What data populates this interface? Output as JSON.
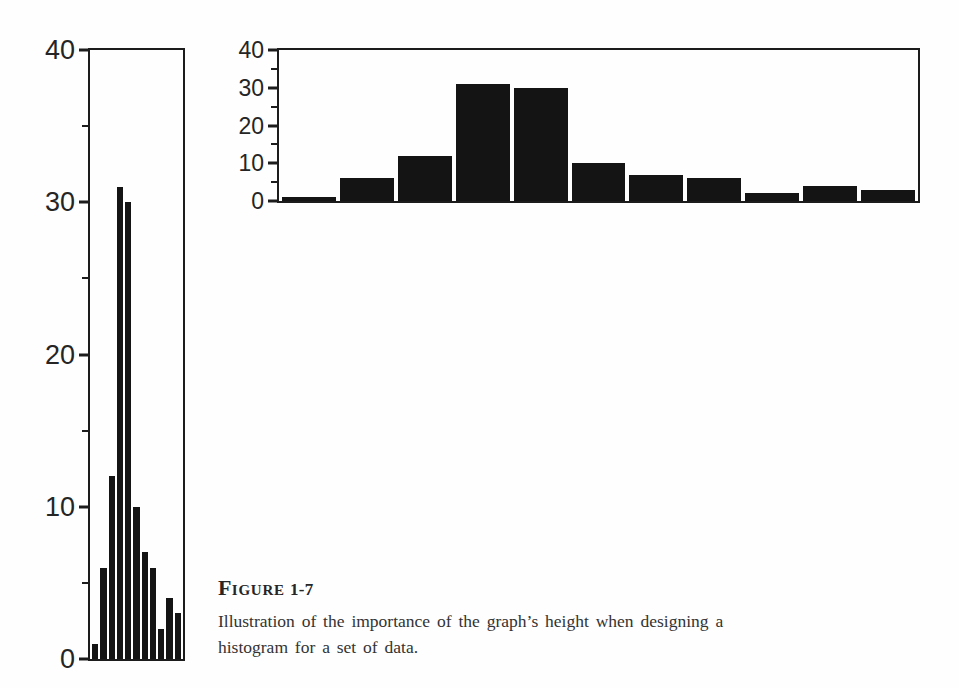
{
  "page": {
    "background": "#fefefe",
    "ink_color": "#1c1c1c",
    "bar_color": "#141414"
  },
  "caption": {
    "label_initial": "F",
    "label_rest": "IGURE",
    "label_number": "1-7",
    "line1": "Illustration of the importance of the graph’s height when designing a",
    "line2": "histogram for a set of data."
  },
  "chart_data": [
    {
      "id": "tall-histogram",
      "type": "bar",
      "shape": "tall-narrow",
      "title": "",
      "xlabel": "",
      "ylabel": "",
      "values": [
        1,
        6,
        12,
        31,
        30,
        10,
        7,
        6,
        2,
        4,
        3
      ],
      "ylim": [
        0,
        40
      ],
      "yticks_major": [
        0,
        10,
        20,
        30,
        40
      ],
      "yticks_minor": [
        5,
        15,
        25,
        35
      ],
      "x_tick_labels": [],
      "grid": false,
      "legend": false,
      "bar_color": "#141414"
    },
    {
      "id": "wide-histogram",
      "type": "bar",
      "shape": "short-wide",
      "title": "",
      "xlabel": "",
      "ylabel": "",
      "values": [
        1,
        6,
        12,
        31,
        30,
        10,
        7,
        6,
        2,
        4,
        3
      ],
      "ylim": [
        0,
        40
      ],
      "yticks_major": [
        0,
        10,
        20,
        30,
        40
      ],
      "yticks_minor": [
        5,
        15,
        25,
        35
      ],
      "x_tick_labels": [],
      "grid": false,
      "legend": false,
      "bar_color": "#141414"
    }
  ]
}
